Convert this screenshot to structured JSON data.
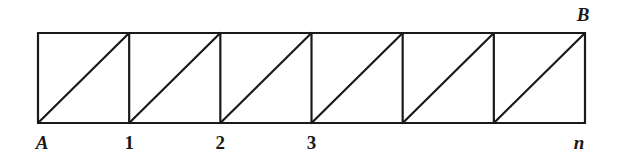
{
  "diagram": {
    "cell_count": 6,
    "top_right_label": "B",
    "bottom_labels": [
      {
        "text": "A",
        "italic": true,
        "node_index": 0
      },
      {
        "text": "1",
        "italic": false,
        "node_index": 1
      },
      {
        "text": "2",
        "italic": false,
        "node_index": 2
      },
      {
        "text": "3",
        "italic": false,
        "node_index": 3
      },
      {
        "text": "n",
        "italic": true,
        "node_index": 6
      }
    ],
    "line_color": "#1a1a1a"
  }
}
